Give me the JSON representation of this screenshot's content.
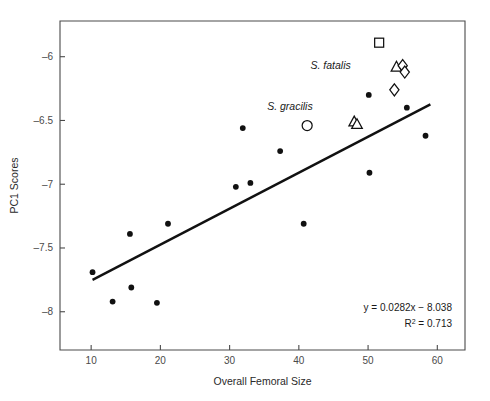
{
  "chart_data": {
    "type": "scatter",
    "title": "",
    "xlabel": "Overall Femoral Size",
    "ylabel": "PC1 Scores",
    "xlim": [
      5.5,
      64
    ],
    "ylim": [
      -8.3,
      -5.72
    ],
    "xticks": [
      10,
      20,
      30,
      40,
      50,
      60
    ],
    "xtick_labels": [
      "10",
      "20",
      "30",
      "40",
      "50",
      "60"
    ],
    "yticks": [
      -6,
      -6.5,
      -7,
      -7.5,
      -8
    ],
    "ytick_labels": [
      "–6",
      "–6.5",
      "–7",
      "–7.5",
      "–8"
    ],
    "grid": false,
    "legend": "none",
    "series": [
      {
        "name": "comparative taxa",
        "marker": "filled-circle",
        "points": [
          {
            "x": 10.2,
            "y": -7.69
          },
          {
            "x": 13.1,
            "y": -7.92
          },
          {
            "x": 15.6,
            "y": -7.39
          },
          {
            "x": 15.8,
            "y": -7.81
          },
          {
            "x": 19.5,
            "y": -7.93
          },
          {
            "x": 21.1,
            "y": -7.31
          },
          {
            "x": 30.9,
            "y": -7.02
          },
          {
            "x": 31.9,
            "y": -6.56
          },
          {
            "x": 33.0,
            "y": -6.99
          },
          {
            "x": 37.3,
            "y": -6.74
          },
          {
            "x": 40.7,
            "y": -7.31
          },
          {
            "x": 50.1,
            "y": -6.3
          },
          {
            "x": 50.2,
            "y": -6.91
          },
          {
            "x": 55.6,
            "y": -6.4
          },
          {
            "x": 58.3,
            "y": -6.62
          }
        ]
      },
      {
        "name": "open square taxon",
        "marker": "open-square",
        "points": [
          {
            "x": 51.6,
            "y": -5.89
          }
        ]
      },
      {
        "name": "open circle taxon",
        "marker": "open-circle",
        "points": [
          {
            "x": 41.2,
            "y": -6.54
          }
        ]
      },
      {
        "name": "S. fatalis",
        "marker": "open-triangle-and-diamond",
        "points": [
          {
            "x": 54.1,
            "y": -6.08,
            "marker": "open-triangle"
          },
          {
            "x": 55.0,
            "y": -6.07,
            "marker": "open-diamond"
          },
          {
            "x": 55.3,
            "y": -6.12,
            "marker": "open-diamond"
          },
          {
            "x": 53.8,
            "y": -6.26,
            "marker": "open-diamond"
          }
        ]
      },
      {
        "name": "S. gracilis",
        "marker": "open-triangle",
        "points": [
          {
            "x": 48.0,
            "y": -6.51,
            "marker": "open-triangle"
          },
          {
            "x": 48.4,
            "y": -6.53,
            "marker": "open-triangle"
          }
        ]
      }
    ],
    "annotations": [
      {
        "id": "s-fatalis",
        "text": "S. fatalis",
        "x": 47.5,
        "y": -6.07,
        "style": "italic"
      },
      {
        "id": "s-gracilis",
        "text": "S. gracilis",
        "x": 42.0,
        "y": -6.39,
        "style": "italic"
      }
    ],
    "trendline": {
      "equation": "y = 0.0282x − 8.038",
      "r_squared_label": "R",
      "r_squared_sup": "2",
      "r_squared_value": " = 0.713",
      "slope": 0.0282,
      "intercept": -8.038,
      "x_start": 10.2,
      "x_end": 59.0
    },
    "colors": {
      "axis": "#4a4a4a",
      "marker": "#111111",
      "line": "#111111",
      "background": "#ffffff"
    }
  }
}
